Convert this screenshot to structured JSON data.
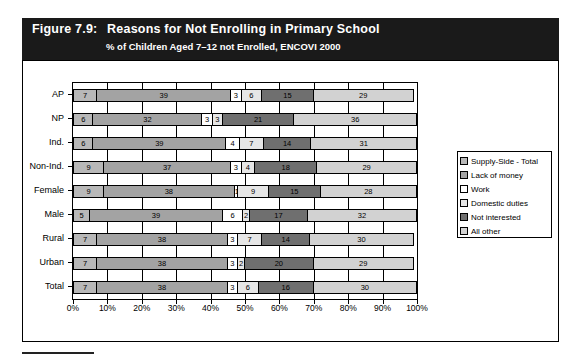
{
  "figure": {
    "label": "Figure 7.9:",
    "title": "Reasons for Not Enrolling in Primary School",
    "subtitle": "% of Children Aged 7–12 not Enrolled, ENCOVI 2000"
  },
  "chart_data": {
    "type": "bar",
    "orientation": "horizontal",
    "stacked": true,
    "normalized_percent": true,
    "title": "Reasons for Not Enrolling in Primary School",
    "subtitle": "% of Children Aged 7–12 not Enrolled, ENCOVI 2000",
    "xlabel": "",
    "ylabel": "",
    "xlim": [
      0,
      100
    ],
    "xticks": [
      0,
      10,
      20,
      30,
      40,
      50,
      60,
      70,
      80,
      90,
      100
    ],
    "xticklabels": [
      "0%",
      "10%",
      "20%",
      "30%",
      "40%",
      "50%",
      "60%",
      "70%",
      "80%",
      "90%",
      "100%"
    ],
    "grid": true,
    "legend_position": "right",
    "categories": [
      "AP",
      "NP",
      "Ind.",
      "Non-Ind.",
      "Female",
      "Male",
      "Rural",
      "Urban",
      "Total"
    ],
    "series": [
      {
        "name": "Supply-Side - Total",
        "color": "#b8b8b8",
        "values": [
          7,
          6,
          6,
          9,
          9,
          5,
          7,
          7,
          7
        ]
      },
      {
        "name": "Lack of money",
        "color": "#a3a3a3",
        "values": [
          39,
          32,
          39,
          37,
          38,
          39,
          38,
          38,
          38
        ]
      },
      {
        "name": "Work",
        "color": "#ffffff",
        "values": [
          3,
          3,
          4,
          3,
          1,
          6,
          3,
          3,
          3
        ]
      },
      {
        "name": "Domestic duties",
        "color": "#e6e6e6",
        "values": [
          6,
          3,
          7,
          4,
          9,
          2,
          7,
          2,
          6
        ]
      },
      {
        "name": "Not interested",
        "color": "#6f6f6f",
        "values": [
          15,
          21,
          14,
          18,
          15,
          17,
          14,
          20,
          16
        ]
      },
      {
        "name": "All other",
        "color": "#d2d2d2",
        "values": [
          29,
          36,
          31,
          29,
          28,
          32,
          30,
          29,
          30
        ]
      }
    ]
  }
}
